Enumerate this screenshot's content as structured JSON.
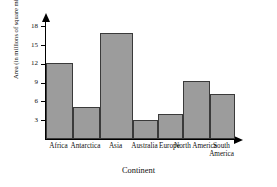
{
  "chart_data": {
    "type": "bar",
    "title": "",
    "xlabel": "Continent",
    "ylabel": "Area (in millions of square miles)",
    "categories": [
      "Africa",
      "Antarctica",
      "Asia",
      "Australia",
      "Europe",
      "North America",
      "South America"
    ],
    "values": [
      12.2,
      5.1,
      17.0,
      3.1,
      4.0,
      9.2,
      7.2
    ],
    "ylim": [
      0,
      19
    ],
    "yticks": [
      3,
      6,
      9,
      12,
      15,
      18
    ],
    "ytick_labels": [
      "3",
      "6",
      "9",
      "12",
      "15",
      "18"
    ],
    "grid": false,
    "legend": null,
    "bar_color": "#9c9c9c",
    "bar_border_color": "#3a3a3a",
    "axis_color": "#000000"
  },
  "axes": {
    "y_arrow": "up-arrow-icon",
    "x_arrow": "right-arrow-icon"
  }
}
